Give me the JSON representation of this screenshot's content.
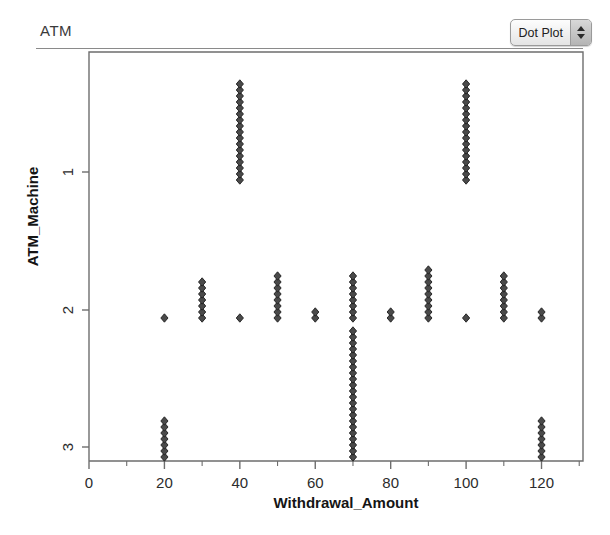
{
  "panel": {
    "title": "ATM"
  },
  "plot_type_control": {
    "value": "Dot Plot",
    "stepper_up_icon": "triangle-up-icon",
    "stepper_down_icon": "triangle-down-icon"
  },
  "chart_data": {
    "type": "scatter",
    "subtype": "dot-plot",
    "title": "ATM",
    "xlabel": "Withdrawal_Amount",
    "ylabel": "ATM_Machine",
    "xlim": [
      0,
      131
    ],
    "xticks": [
      0,
      20,
      40,
      60,
      80,
      100,
      120
    ],
    "xticklabels": [
      "0",
      "20",
      "40",
      "60",
      "80",
      "100",
      "120"
    ],
    "xminorticks": [
      10,
      30,
      50,
      70,
      90,
      110,
      130
    ],
    "ycategories": [
      "1",
      "2",
      "3"
    ],
    "yticklabels": [
      "1",
      "2",
      "3"
    ],
    "grid": false,
    "legend": false,
    "marker": "diamond",
    "marker_color": "#4a4a4a",
    "stacks": [
      {
        "machine": "1",
        "amount": 40,
        "count": 17
      },
      {
        "machine": "1",
        "amount": 100,
        "count": 17
      },
      {
        "machine": "2",
        "amount": 20,
        "count": 1
      },
      {
        "machine": "2",
        "amount": 30,
        "count": 7
      },
      {
        "machine": "2",
        "amount": 40,
        "count": 1
      },
      {
        "machine": "2",
        "amount": 50,
        "count": 8
      },
      {
        "machine": "2",
        "amount": 60,
        "count": 2
      },
      {
        "machine": "2",
        "amount": 70,
        "count": 8
      },
      {
        "machine": "2",
        "amount": 80,
        "count": 2
      },
      {
        "machine": "2",
        "amount": 90,
        "count": 9
      },
      {
        "machine": "2",
        "amount": 100,
        "count": 1
      },
      {
        "machine": "2",
        "amount": 110,
        "count": 8
      },
      {
        "machine": "2",
        "amount": 120,
        "count": 2
      },
      {
        "machine": "3",
        "amount": 20,
        "count": 7
      },
      {
        "machine": "3",
        "amount": 70,
        "count": 22
      },
      {
        "machine": "3",
        "amount": 120,
        "count": 7
      }
    ]
  }
}
